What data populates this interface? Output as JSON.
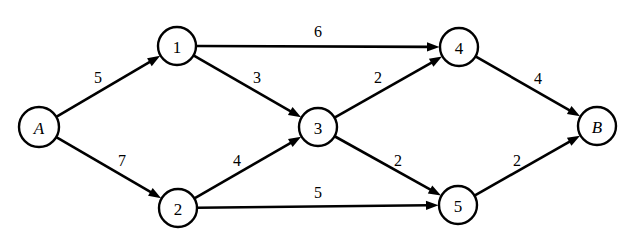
{
  "diagram": {
    "type": "directed-weighted-graph",
    "colors": {
      "background": "#ffffff",
      "stroke": "#000000",
      "node_fill": "#ffffff",
      "text": "#000000"
    },
    "nodes": [
      {
        "id": "A",
        "label": "A",
        "style": "terminal",
        "cx": 39,
        "cy": 127,
        "r": 20
      },
      {
        "id": "1",
        "label": "1",
        "style": "numbered",
        "cx": 177,
        "cy": 46,
        "r": 19
      },
      {
        "id": "2",
        "label": "2",
        "style": "numbered",
        "cx": 178,
        "cy": 208,
        "r": 19
      },
      {
        "id": "3",
        "label": "3",
        "style": "numbered",
        "cx": 318,
        "cy": 127,
        "r": 19
      },
      {
        "id": "4",
        "label": "4",
        "style": "numbered",
        "cx": 459,
        "cy": 47,
        "r": 19
      },
      {
        "id": "5",
        "label": "5",
        "style": "numbered",
        "cx": 458,
        "cy": 205,
        "r": 19
      },
      {
        "id": "B",
        "label": "B",
        "style": "terminal",
        "cx": 597,
        "cy": 126,
        "r": 19
      }
    ],
    "edges": [
      {
        "from": "A",
        "to": "1",
        "weight": "5",
        "label_x": 98,
        "label_y": 77
      },
      {
        "from": "A",
        "to": "2",
        "weight": "7",
        "label_x": 122,
        "label_y": 160
      },
      {
        "from": "1",
        "to": "4",
        "weight": "6",
        "label_x": 318,
        "label_y": 31
      },
      {
        "from": "1",
        "to": "3",
        "weight": "3",
        "label_x": 257,
        "label_y": 77
      },
      {
        "from": "2",
        "to": "3",
        "weight": "4",
        "label_x": 237,
        "label_y": 160
      },
      {
        "from": "2",
        "to": "5",
        "weight": "5",
        "label_x": 318,
        "label_y": 192
      },
      {
        "from": "3",
        "to": "4",
        "weight": "2",
        "label_x": 378,
        "label_y": 77
      },
      {
        "from": "3",
        "to": "5",
        "weight": "2",
        "label_x": 398,
        "label_y": 160
      },
      {
        "from": "4",
        "to": "B",
        "weight": "4",
        "label_x": 538,
        "label_y": 78
      },
      {
        "from": "5",
        "to": "B",
        "weight": "2",
        "label_x": 517,
        "label_y": 160
      }
    ]
  }
}
